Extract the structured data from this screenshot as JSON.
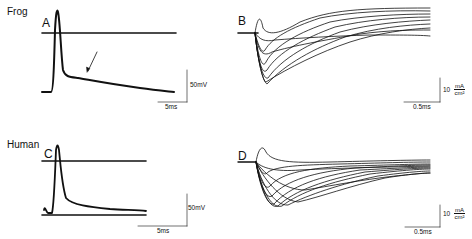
{
  "figure": {
    "rows": [
      {
        "species": "Frog",
        "panels": [
          "A",
          "B"
        ]
      },
      {
        "species": "Human",
        "panels": [
          "C",
          "D"
        ]
      }
    ],
    "panels": {
      "A": {
        "label": "A",
        "type": "action potential (voltage)",
        "scale_y": "50mV",
        "scale_x": "5ms"
      },
      "B": {
        "label": "B",
        "type": "family of membrane currents",
        "scale_y_value": "10",
        "scale_y_num": "mA",
        "scale_y_den": "cm²",
        "scale_x": "0.5ms"
      },
      "C": {
        "label": "C",
        "type": "action potential (voltage)",
        "scale_y": "50mV",
        "scale_x": "5ms"
      },
      "D": {
        "label": "D",
        "type": "family of membrane currents",
        "scale_y_value": "10",
        "scale_y_num": "mA",
        "scale_y_den": "cm²",
        "scale_x": "0.5ms"
      }
    },
    "labels": {
      "frog": "Frog",
      "human": "Human"
    },
    "ink_color": "#111111"
  }
}
